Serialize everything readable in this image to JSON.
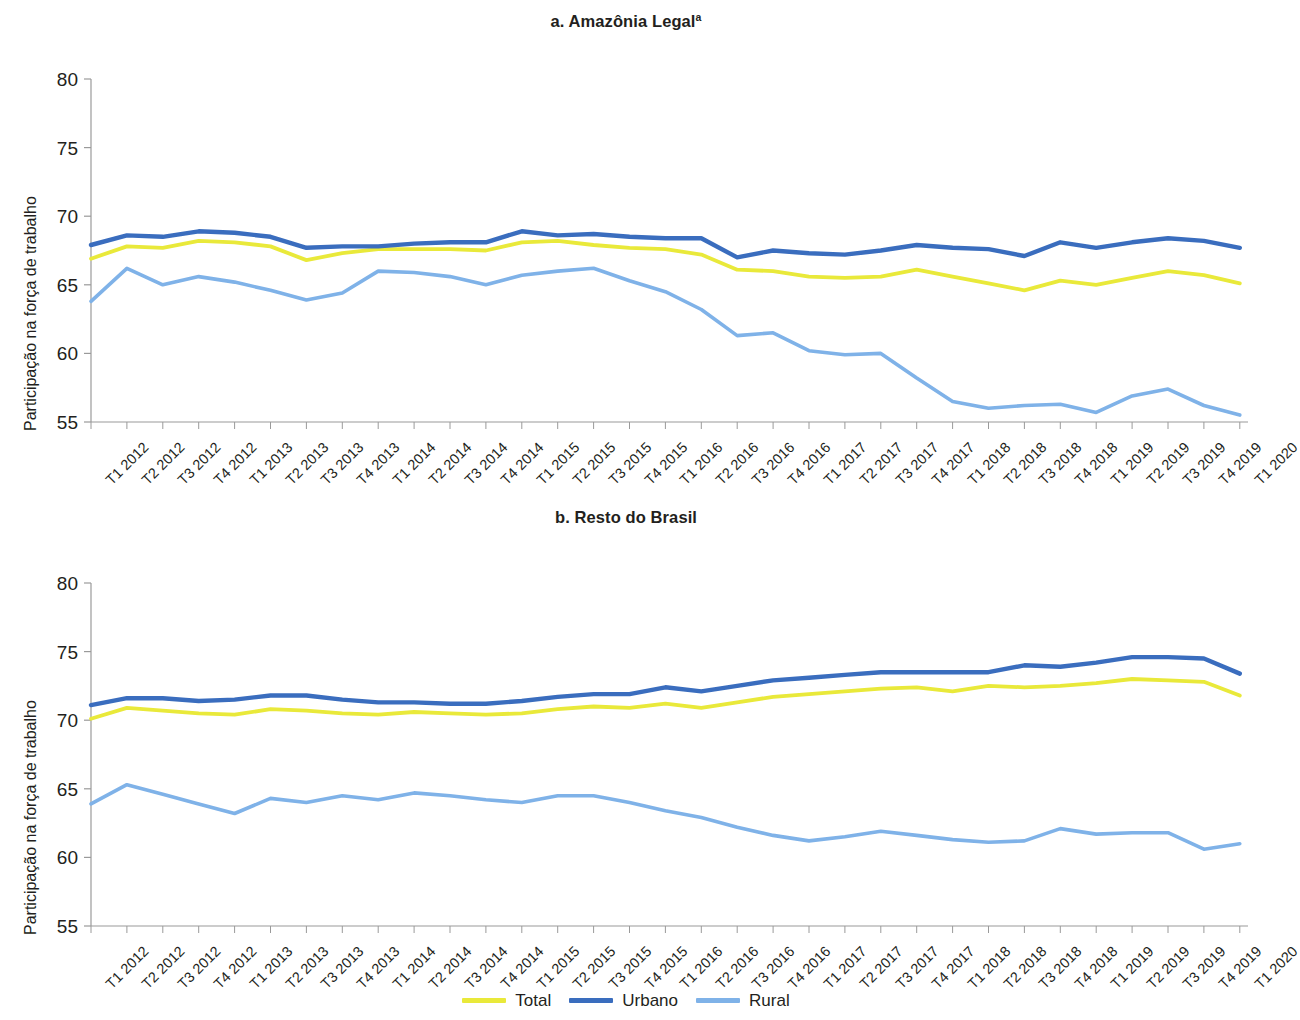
{
  "figure": {
    "legend": {
      "items": [
        {
          "label": "Total",
          "color": "#e9e93a"
        },
        {
          "label": "Urbano",
          "color": "#3a6dbe"
        },
        {
          "label": "Rural",
          "color": "#7fb2e8"
        }
      ]
    },
    "axis_label_y": "Participação na força de trabalho",
    "categories": [
      "T1 2012",
      "T2 2012",
      "T3 2012",
      "T4 2012",
      "T1 2013",
      "T2 2013",
      "T3 2013",
      "T4 2013",
      "T1 2014",
      "T2 2014",
      "T3 2014",
      "T4 2014",
      "T1 2015",
      "T2 2015",
      "T3 2015",
      "T4 2015",
      "T1 2016",
      "T2 2016",
      "T3 2016",
      "T4 2016",
      "T1 2017",
      "T2 2017",
      "T3 2017",
      "T4 2017",
      "T1 2018",
      "T2 2018",
      "T3 2018",
      "T4 2018",
      "T1 2019",
      "T2 2019",
      "T3 2019",
      "T4 2019",
      "T1 2020"
    ],
    "yticks": [
      55,
      60,
      65,
      70,
      75,
      80
    ]
  },
  "panel_a": {
    "title": "a. Amazônia Legal",
    "title_superscript": "a"
  },
  "panel_b": {
    "title": "b. Resto do Brasil",
    "title_superscript": ""
  },
  "chart_data": [
    {
      "type": "line",
      "title": "a. Amazônia Legal",
      "title_note": "a",
      "xlabel": "",
      "ylabel": "Participação na força de trabalho",
      "ylim": [
        55,
        80
      ],
      "yticks": [
        55,
        60,
        65,
        70,
        75,
        80
      ],
      "grid": false,
      "legend_position": "bottom",
      "x": [
        "T1 2012",
        "T2 2012",
        "T3 2012",
        "T4 2012",
        "T1 2013",
        "T2 2013",
        "T3 2013",
        "T4 2013",
        "T1 2014",
        "T2 2014",
        "T3 2014",
        "T4 2014",
        "T1 2015",
        "T2 2015",
        "T3 2015",
        "T4 2015",
        "T1 2016",
        "T2 2016",
        "T3 2016",
        "T4 2016",
        "T1 2017",
        "T2 2017",
        "T3 2017",
        "T4 2017",
        "T1 2018",
        "T2 2018",
        "T3 2018",
        "T4 2018",
        "T1 2019",
        "T2 2019",
        "T3 2019",
        "T4 2019",
        "T1 2020"
      ],
      "series": [
        {
          "name": "Total",
          "color": "#e9e93a",
          "values": [
            66.9,
            67.8,
            67.7,
            68.2,
            68.1,
            67.8,
            66.8,
            67.3,
            67.6,
            67.6,
            67.6,
            67.5,
            68.1,
            68.2,
            67.9,
            67.7,
            67.6,
            67.2,
            66.1,
            66.0,
            65.6,
            65.5,
            65.6,
            66.1,
            65.6,
            65.1,
            64.6,
            65.3,
            65.0,
            65.5,
            66.0,
            65.7,
            65.1
          ]
        },
        {
          "name": "Urbano",
          "color": "#3a6dbe",
          "values": [
            67.9,
            68.6,
            68.5,
            68.9,
            68.8,
            68.5,
            67.7,
            67.8,
            67.8,
            68.0,
            68.1,
            68.1,
            68.9,
            68.6,
            68.7,
            68.5,
            68.4,
            68.4,
            67.0,
            67.5,
            67.3,
            67.2,
            67.5,
            67.9,
            67.7,
            67.6,
            67.1,
            68.1,
            67.7,
            68.1,
            68.4,
            68.2,
            67.7
          ]
        },
        {
          "name": "Rural",
          "color": "#7fb2e8",
          "values": [
            63.8,
            66.2,
            65.0,
            65.6,
            65.2,
            64.6,
            63.9,
            64.4,
            66.0,
            65.9,
            65.6,
            65.0,
            65.7,
            66.0,
            66.2,
            65.3,
            64.5,
            63.2,
            61.3,
            61.5,
            60.2,
            59.9,
            60.0,
            58.2,
            56.5,
            56.0,
            56.2,
            56.3,
            55.7,
            56.9,
            57.4,
            56.2,
            55.5
          ]
        }
      ]
    },
    {
      "type": "line",
      "title": "b. Resto do Brasil",
      "title_note": "",
      "xlabel": "",
      "ylabel": "Participação na força de trabalho",
      "ylim": [
        55,
        80
      ],
      "yticks": [
        55,
        60,
        65,
        70,
        75,
        80
      ],
      "grid": false,
      "legend_position": "bottom",
      "x": [
        "T1 2012",
        "T2 2012",
        "T3 2012",
        "T4 2012",
        "T1 2013",
        "T2 2013",
        "T3 2013",
        "T4 2013",
        "T1 2014",
        "T2 2014",
        "T3 2014",
        "T4 2014",
        "T1 2015",
        "T2 2015",
        "T3 2015",
        "T4 2015",
        "T1 2016",
        "T2 2016",
        "T3 2016",
        "T4 2016",
        "T1 2017",
        "T2 2017",
        "T3 2017",
        "T4 2017",
        "T1 2018",
        "T2 2018",
        "T3 2018",
        "T4 2018",
        "T1 2019",
        "T2 2019",
        "T3 2019",
        "T4 2019",
        "T1 2020"
      ],
      "series": [
        {
          "name": "Total",
          "color": "#e9e93a",
          "values": [
            70.1,
            70.9,
            70.7,
            70.5,
            70.4,
            70.8,
            70.7,
            70.5,
            70.4,
            70.6,
            70.5,
            70.4,
            70.5,
            70.8,
            71.0,
            70.9,
            71.2,
            70.9,
            71.3,
            71.7,
            71.9,
            72.1,
            72.3,
            72.4,
            72.1,
            72.5,
            72.4,
            72.5,
            72.7,
            73.0,
            72.9,
            72.8,
            71.8
          ]
        },
        {
          "name": "Urbano",
          "color": "#3a6dbe",
          "values": [
            71.1,
            71.6,
            71.6,
            71.4,
            71.5,
            71.8,
            71.8,
            71.5,
            71.3,
            71.3,
            71.2,
            71.2,
            71.4,
            71.7,
            71.9,
            71.9,
            72.4,
            72.1,
            72.5,
            72.9,
            73.1,
            73.3,
            73.5,
            73.5,
            73.5,
            73.5,
            74.0,
            73.9,
            74.2,
            74.6,
            74.6,
            74.5,
            73.4
          ]
        },
        {
          "name": "Rural",
          "color": "#7fb2e8",
          "values": [
            63.9,
            65.3,
            64.6,
            63.9,
            63.2,
            64.3,
            64.0,
            64.5,
            64.2,
            64.7,
            64.5,
            64.2,
            64.0,
            64.5,
            64.5,
            64.0,
            63.4,
            62.9,
            62.2,
            61.6,
            61.2,
            61.5,
            61.9,
            61.6,
            61.3,
            61.1,
            61.2,
            62.1,
            61.7,
            61.8,
            61.8,
            60.6,
            61.0
          ]
        }
      ]
    }
  ]
}
